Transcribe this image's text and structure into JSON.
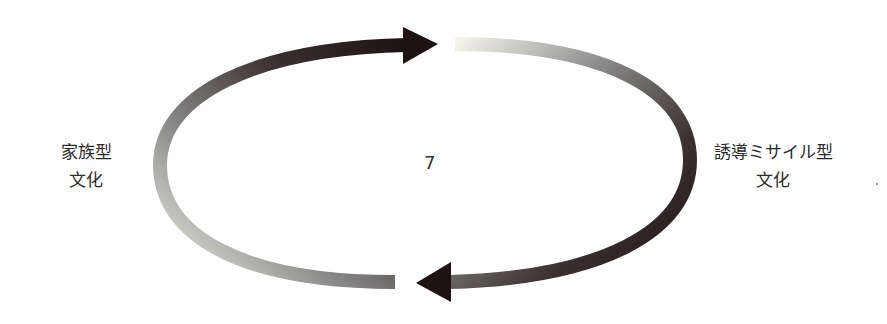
{
  "diagram": {
    "left_label": {
      "line1": "家族型",
      "line2": "文化"
    },
    "right_label": {
      "line1": "誘導ミサイル型",
      "line2": "文化"
    },
    "center_text": "7",
    "arrows": [
      {
        "name": "top-arrow",
        "direction": "right",
        "gradient_from": "#f4f4ea",
        "gradient_to": "#231616"
      },
      {
        "name": "bottom-arrow",
        "direction": "left",
        "gradient_from": "#f4f4ea",
        "gradient_to": "#231616"
      }
    ],
    "colors": {
      "dark": "#231616",
      "mid": "#6b6b6b",
      "light": "#f2f2e6",
      "background": "#ffffff"
    }
  }
}
